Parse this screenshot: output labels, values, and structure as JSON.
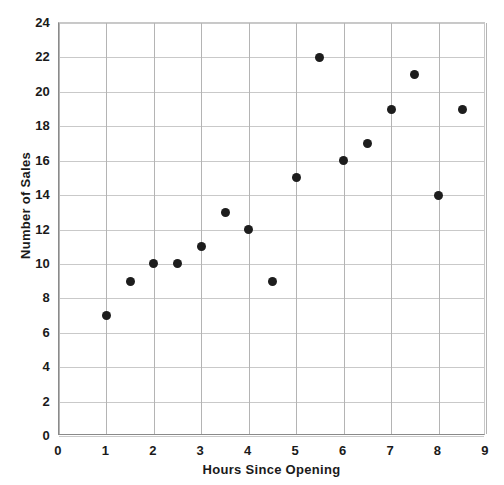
{
  "chart_data": {
    "type": "scatter",
    "title": "",
    "xlabel": "Hours Since Opening",
    "ylabel": "Number of Sales",
    "xlim": [
      0,
      9
    ],
    "ylim": [
      0,
      24
    ],
    "xticks": [
      0,
      1,
      2,
      3,
      4,
      5,
      6,
      7,
      8,
      9
    ],
    "yticks": [
      0,
      2,
      4,
      6,
      8,
      10,
      12,
      14,
      16,
      18,
      20,
      22,
      24
    ],
    "xtick_labels": [
      "0",
      "1",
      "2",
      "3",
      "4",
      "5",
      "6",
      "7",
      "8",
      "9"
    ],
    "ytick_labels": [
      "0",
      "2",
      "4",
      "6",
      "8",
      "10",
      "12",
      "14",
      "16",
      "18",
      "20",
      "22",
      "24"
    ],
    "grid": true,
    "legend": false,
    "marker_color": "#1d1d1d",
    "marker": "circle",
    "series": [
      {
        "name": "Sales",
        "points": [
          {
            "x": 1,
            "y": 7
          },
          {
            "x": 1.5,
            "y": 9
          },
          {
            "x": 2,
            "y": 10
          },
          {
            "x": 2.5,
            "y": 10
          },
          {
            "x": 3,
            "y": 11
          },
          {
            "x": 3.5,
            "y": 13
          },
          {
            "x": 4,
            "y": 12
          },
          {
            "x": 4.5,
            "y": 9
          },
          {
            "x": 5,
            "y": 15
          },
          {
            "x": 5.5,
            "y": 22
          },
          {
            "x": 6,
            "y": 16
          },
          {
            "x": 6.5,
            "y": 17
          },
          {
            "x": 7,
            "y": 19
          },
          {
            "x": 7.5,
            "y": 21
          },
          {
            "x": 8,
            "y": 14
          },
          {
            "x": 8.5,
            "y": 19
          }
        ]
      }
    ]
  }
}
